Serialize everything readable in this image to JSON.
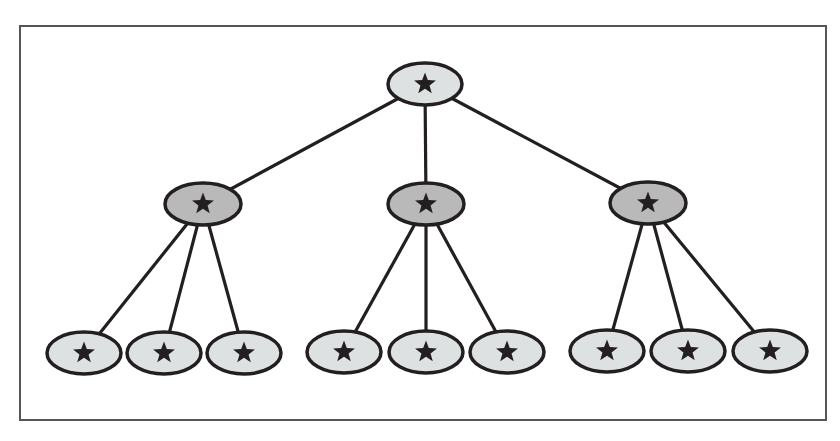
{
  "diagram": {
    "type": "tree",
    "frame": {
      "x": 20,
      "y": 26,
      "width": 806,
      "height": 394
    },
    "colors": {
      "stroke": "#231f20",
      "root_fill": "#dde1e1",
      "level1_fill": "#b9b9b9",
      "leaf_fill": "#dde1e1",
      "star": "#231f20"
    },
    "node_glyph": "★",
    "root": {
      "id": "root",
      "cx": 425,
      "cy": 84,
      "rx": 37,
      "ry": 21,
      "icon": "star-icon"
    },
    "level1": [
      {
        "id": "n1",
        "cx": 203,
        "cy": 204,
        "rx": 38,
        "ry": 21,
        "icon": "star-icon"
      },
      {
        "id": "n2",
        "cx": 426,
        "cy": 204,
        "rx": 38,
        "ry": 21,
        "icon": "star-icon"
      },
      {
        "id": "n3",
        "cx": 648,
        "cy": 203,
        "rx": 38,
        "ry": 21,
        "icon": "star-icon"
      }
    ],
    "leaves": [
      {
        "id": "l1",
        "parent": "n1",
        "cx": 84,
        "cy": 353,
        "rx": 37,
        "ry": 21
      },
      {
        "id": "l2",
        "parent": "n1",
        "cx": 164,
        "cy": 353,
        "rx": 37,
        "ry": 21
      },
      {
        "id": "l3",
        "parent": "n1",
        "cx": 244,
        "cy": 353,
        "rx": 37,
        "ry": 21
      },
      {
        "id": "l4",
        "parent": "n2",
        "cx": 344,
        "cy": 352,
        "rx": 37,
        "ry": 21
      },
      {
        "id": "l5",
        "parent": "n2",
        "cx": 426,
        "cy": 352,
        "rx": 37,
        "ry": 21
      },
      {
        "id": "l6",
        "parent": "n2",
        "cx": 507,
        "cy": 352,
        "rx": 37,
        "ry": 21
      },
      {
        "id": "l7",
        "parent": "n3",
        "cx": 607,
        "cy": 351,
        "rx": 37,
        "ry": 21
      },
      {
        "id": "l8",
        "parent": "n3",
        "cx": 688,
        "cy": 351,
        "rx": 37,
        "ry": 21
      },
      {
        "id": "l9",
        "parent": "n3",
        "cx": 770,
        "cy": 351,
        "rx": 37,
        "ry": 21
      }
    ]
  }
}
